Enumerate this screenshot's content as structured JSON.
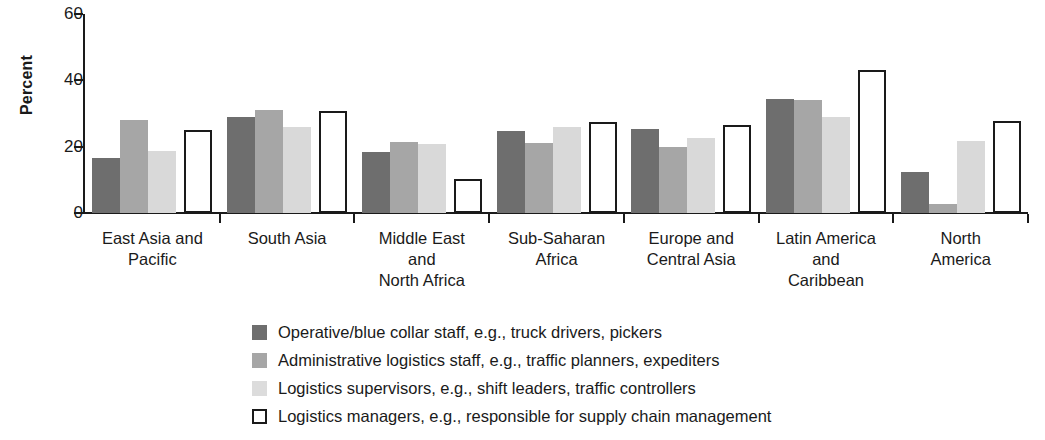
{
  "chart_data": {
    "type": "bar",
    "title": "",
    "xlabel": "",
    "ylabel": "Percent",
    "ylim": [
      0,
      60
    ],
    "yticks": [
      0,
      20,
      40,
      60
    ],
    "ytick_labels": [
      "0",
      "20",
      "40",
      "60"
    ],
    "grid": false,
    "legend_position": "bottom",
    "categories": [
      "East Asia and\nPacific",
      "South Asia",
      "Middle East\nand\nNorth Africa",
      "Sub-Saharan\nAfrica",
      "Europe and\nCentral Asia",
      "Latin America\nand\nCaribbean",
      "North\nAmerica"
    ],
    "category_lines": [
      [
        "East Asia and",
        "Pacific"
      ],
      [
        "South Asia"
      ],
      [
        "Middle East",
        "and",
        "North Africa"
      ],
      [
        "Sub-Saharan",
        "Africa"
      ],
      [
        "Europe and",
        "Central Asia"
      ],
      [
        "Latin America",
        "and",
        "Caribbean"
      ],
      [
        "North",
        "America"
      ]
    ],
    "series": [
      {
        "name": "Operative/blue collar staff, e.g., truck drivers, pickers",
        "color": "#6e6e6e",
        "values": [
          16.5,
          29.0,
          18.4,
          24.7,
          25.2,
          34.5,
          12.3
        ]
      },
      {
        "name": "Administrative logistics staff, e.g., traffic planners, expediters",
        "color": "#a6a6a6",
        "values": [
          28.0,
          31.2,
          21.3,
          21.2,
          19.8,
          34.0,
          2.6
        ]
      },
      {
        "name": "Logistics supervisors, e.g., shift leaders, traffic controllers",
        "color": "#d9d9d9",
        "values": [
          18.7,
          26.0,
          20.8,
          25.8,
          22.6,
          29.0,
          21.6
        ]
      },
      {
        "name": "Logistics managers, e.g., responsible for supply chain management",
        "color": "#ffffff",
        "values": [
          25.0,
          30.8,
          10.4,
          27.5,
          26.4,
          43.0,
          27.6
        ]
      }
    ]
  },
  "legend": {
    "items": [
      {
        "swatch": "dark-gray-swatch",
        "label": "Operative/blue collar staff, e.g., truck drivers, pickers"
      },
      {
        "swatch": "medium-gray-swatch",
        "label": "Administrative logistics staff, e.g., traffic planners, expediters"
      },
      {
        "swatch": "light-gray-swatch",
        "label": "Logistics supervisors, e.g., shift leaders, traffic controllers"
      },
      {
        "swatch": "white-outline-swatch",
        "label": "Logistics managers, e.g., responsible for supply chain management"
      }
    ]
  }
}
